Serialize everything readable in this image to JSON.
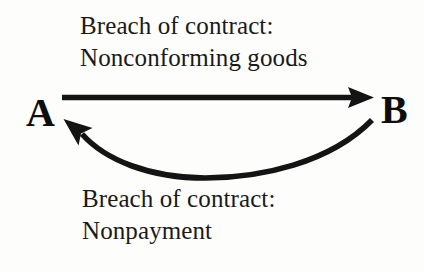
{
  "diagram": {
    "background_color": "#fdfdfc",
    "ink_color": "#141414",
    "nodes": [
      {
        "id": "a",
        "label": "A"
      },
      {
        "id": "b",
        "label": "B"
      }
    ],
    "edges": [
      {
        "id": "a-to-b",
        "from": "A",
        "to": "B",
        "style": "straight",
        "direction": "left-to-right",
        "label_lines": [
          "Breach of contract:",
          "Nonconforming goods"
        ],
        "label_position": "above"
      },
      {
        "id": "b-to-a",
        "from": "B",
        "to": "A",
        "style": "curved-arc",
        "direction": "right-to-left",
        "label_lines": [
          "Breach of contract:",
          "Nonpayment"
        ],
        "label_position": "below"
      }
    ],
    "top_label": {
      "line1": "Breach of contract:",
      "line2": "Nonconforming goods"
    },
    "bottom_label": {
      "line1": "Breach of contract:",
      "line2": "Nonpayment"
    }
  }
}
